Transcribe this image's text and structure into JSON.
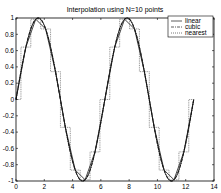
{
  "chart_data": {
    "type": "line",
    "title": "Interpolation using N=10 points",
    "xlabel": "",
    "ylabel": "",
    "xlim": [
      0,
      14
    ],
    "ylim": [
      -1,
      1
    ],
    "x_ticks": [
      0,
      2,
      4,
      6,
      8,
      10,
      12,
      14
    ],
    "y_ticks": [
      -1,
      -0.8,
      -0.6,
      -0.4,
      -0.2,
      0,
      0.2,
      0.4,
      0.6,
      0.8,
      1
    ],
    "x_tick_labels": [
      "0",
      "2",
      "4",
      "6",
      "8",
      "10",
      "12",
      "14"
    ],
    "y_tick_labels": [
      "-1",
      "-0.8",
      "-0.6",
      "-0.4",
      "-0.2",
      "0",
      "0.2",
      "0.4",
      "0.6",
      "0.8",
      "1"
    ],
    "grid": false,
    "legend_position": "upper right",
    "underlying_function": "sin(x)",
    "sample_points": {
      "x": [
        0,
        0.698,
        1.396,
        2.094,
        2.793,
        3.491,
        4.189,
        4.887,
        5.585,
        6.283,
        6.981,
        7.679,
        8.378,
        9.076,
        9.774,
        10.472,
        11.17,
        11.868,
        12.566
      ],
      "y": [
        0,
        0.643,
        0.985,
        0.866,
        0.342,
        -0.342,
        -0.866,
        -0.985,
        -0.643,
        0,
        0.643,
        0.985,
        0.866,
        0.342,
        -0.342,
        -0.866,
        -0.985,
        -0.643,
        0
      ]
    },
    "series": [
      {
        "name": "linear",
        "style": "solid"
      },
      {
        "name": "cubic",
        "style": "dashdot"
      },
      {
        "name": "nearest",
        "style": "dotted"
      }
    ]
  },
  "legend": {
    "items": [
      "linear",
      "cubic",
      "nearest"
    ]
  }
}
